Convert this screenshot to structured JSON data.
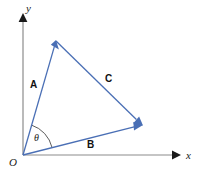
{
  "figure": {
    "name": "vector-triangle-diagram",
    "background_color": "#ffffff",
    "vector_color": "#4a6fb5",
    "axis_color": "#8c8c8c",
    "arrowhead_color": "#1a1a1a",
    "text_color": "#1a1a1a"
  },
  "axes": {
    "x_label": "x",
    "y_label": "y",
    "origin_label": "O",
    "x_axis": {
      "start": [
        23,
        155
      ],
      "end": [
        180,
        155
      ]
    },
    "y_axis": {
      "start": [
        23,
        155
      ],
      "end": [
        23,
        14
      ]
    }
  },
  "angle": {
    "symbol": "θ",
    "label_position": [
      34,
      141
    ],
    "arc_radius": 31
  },
  "vectors": [
    {
      "name": "A",
      "label": "A",
      "label_position": [
        30,
        88
      ],
      "start": [
        23,
        155
      ],
      "end": [
        56,
        41
      ],
      "color": "#4a6fb5"
    },
    {
      "name": "B",
      "label": "B",
      "label_position": [
        87,
        148
      ],
      "start": [
        23,
        155
      ],
      "end": [
        142,
        125
      ],
      "color": "#4a6fb5"
    },
    {
      "name": "C",
      "label": "C",
      "label_position": [
        105,
        82
      ],
      "start": [
        56,
        41
      ],
      "end": [
        142,
        125
      ],
      "color": "#4a6fb5"
    }
  ]
}
